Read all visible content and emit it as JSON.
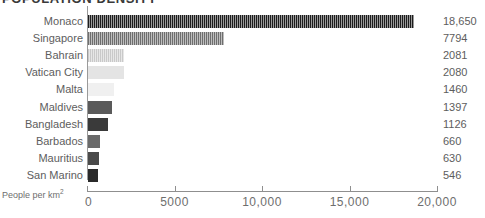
{
  "chart_data": {
    "type": "bar",
    "orientation": "horizontal",
    "title": "POPULATION DENSITY",
    "xlabel": "People per km",
    "xlabel_sup": "2",
    "ylabel": "",
    "categories": [
      "Monaco",
      "Singapore",
      "Bahrain",
      "Vatican City",
      "Malta",
      "Maldives",
      "Bangladesh",
      "Barbados",
      "Mauritius",
      "San Marino"
    ],
    "values": [
      18650,
      7794,
      2081,
      2080,
      1460,
      1397,
      1126,
      660,
      630,
      546
    ],
    "value_labels": [
      "18,650",
      "7794",
      "2081",
      "2080",
      "1460",
      "1397",
      "1126",
      "660",
      "630",
      "546"
    ],
    "xlim": [
      0,
      20000
    ],
    "xticks": [
      0,
      5000,
      10000,
      15000,
      20000
    ],
    "xtick_labels": [
      "0",
      "5000",
      "10,000",
      "15,000",
      "20,000"
    ],
    "grid": false,
    "legend": false,
    "bar_colors": [
      "#1c1c1c",
      "#6e6e6e",
      "#c9c9c9",
      "#e4e4e4",
      "#f0f0f0",
      "#5a5a5a",
      "#3a3a3a",
      "#6a6a6a",
      "#4a4a4a",
      "#2a2a2a"
    ],
    "bar_hatched": [
      true,
      true,
      true,
      false,
      false,
      false,
      false,
      false,
      false,
      false
    ]
  },
  "colors": {
    "axis": "#8f8f8f",
    "text": "#5d5d5d",
    "tick_text": "#6e6e6e",
    "title": "#3a3a3a",
    "background": "#ffffff"
  }
}
